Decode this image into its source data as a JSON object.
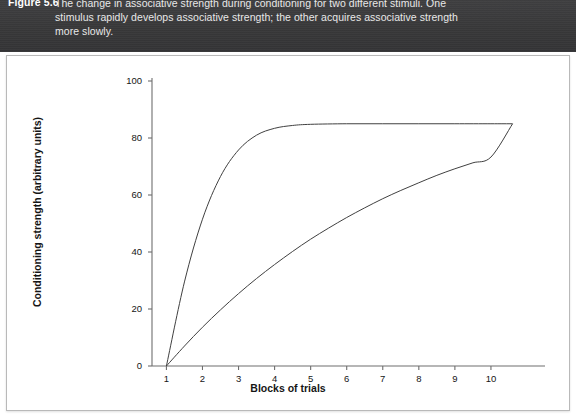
{
  "figure": {
    "number_label": "Figure 5.6",
    "caption_lines": [
      "The change in associative strength during conditioning for two different stimuli. One",
      "stimulus rapidly develops associative strength; the other acquires associative strength",
      "more slowly."
    ],
    "header_bg": "#3a3a3c",
    "header_text_color": "#e8e8e8",
    "panel_bg": "#ffffff"
  },
  "chart_data": {
    "type": "line",
    "title": "",
    "xlabel": "Blocks of trials",
    "ylabel": "Conditioning strength (arbitrary units)",
    "xlim": [
      0.6,
      11.0
    ],
    "ylim": [
      0,
      100
    ],
    "xticks": [
      1,
      2,
      3,
      4,
      5,
      6,
      7,
      8,
      9,
      10
    ],
    "xtick_labels": [
      "1",
      "2",
      "3",
      "4",
      "5",
      "6",
      "7",
      "8",
      "9",
      "10"
    ],
    "yticks": [
      0,
      20,
      40,
      60,
      80,
      100
    ],
    "ytick_labels": [
      "0",
      "20",
      "40",
      "60",
      "80",
      "100"
    ],
    "grid": false,
    "legend": "none",
    "line_color": "#404040",
    "asymptote": 85,
    "series": [
      {
        "name": "rapid-acquisition-stimulus",
        "description": "stimulus that rapidly develops associative strength",
        "x": [
          1,
          1.5,
          2,
          2.5,
          3,
          3.5,
          4,
          4.5,
          5,
          6,
          7,
          8,
          9,
          10,
          10.6
        ],
        "values": [
          0,
          29.5,
          51.5,
          66.5,
          75.8,
          81.0,
          83.4,
          84.4,
          84.8,
          85.0,
          85.0,
          85.0,
          85.0,
          85.0,
          85.0
        ]
      },
      {
        "name": "slow-acquisition-stimulus",
        "description": "stimulus that acquires associative strength more slowly",
        "x": [
          1,
          1.5,
          2,
          2.5,
          3,
          3.5,
          4,
          4.5,
          5,
          5.5,
          6,
          6.5,
          7,
          7.5,
          8,
          8.5,
          9,
          9.5,
          10,
          10.6
        ],
        "values": [
          0,
          7.0,
          13.6,
          19.7,
          25.4,
          30.7,
          35.6,
          40.2,
          44.5,
          48.4,
          52.1,
          55.5,
          58.7,
          61.6,
          64.3,
          66.9,
          69.2,
          71.3,
          73.3,
          85.0
        ]
      }
    ]
  }
}
